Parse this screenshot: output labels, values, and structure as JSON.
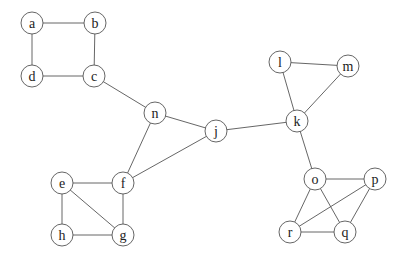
{
  "graph": {
    "node_radius": 11,
    "nodes": [
      {
        "id": "a",
        "label": "a",
        "x": 32,
        "y": 23
      },
      {
        "id": "b",
        "label": "b",
        "x": 95,
        "y": 23
      },
      {
        "id": "c",
        "label": "c",
        "x": 94,
        "y": 76
      },
      {
        "id": "d",
        "label": "d",
        "x": 32,
        "y": 76
      },
      {
        "id": "e",
        "label": "e",
        "x": 62,
        "y": 183
      },
      {
        "id": "f",
        "label": "f",
        "x": 123,
        "y": 183
      },
      {
        "id": "g",
        "label": "g",
        "x": 123,
        "y": 235
      },
      {
        "id": "h",
        "label": "h",
        "x": 62,
        "y": 235
      },
      {
        "id": "j",
        "label": "j",
        "x": 216,
        "y": 131
      },
      {
        "id": "k",
        "label": "k",
        "x": 297,
        "y": 121
      },
      {
        "id": "l",
        "label": "l",
        "x": 280,
        "y": 62
      },
      {
        "id": "m",
        "label": "m",
        "x": 348,
        "y": 66
      },
      {
        "id": "n",
        "label": "n",
        "x": 155,
        "y": 113
      },
      {
        "id": "o",
        "label": "o",
        "x": 315,
        "y": 179
      },
      {
        "id": "p",
        "label": "p",
        "x": 375,
        "y": 179
      },
      {
        "id": "q",
        "label": "q",
        "x": 345,
        "y": 232
      },
      {
        "id": "r",
        "label": "r",
        "x": 290,
        "y": 232
      }
    ],
    "edges": [
      [
        "a",
        "b"
      ],
      [
        "a",
        "d"
      ],
      [
        "b",
        "c"
      ],
      [
        "d",
        "c"
      ],
      [
        "c",
        "n"
      ],
      [
        "n",
        "j"
      ],
      [
        "n",
        "f"
      ],
      [
        "f",
        "j"
      ],
      [
        "j",
        "k"
      ],
      [
        "e",
        "f"
      ],
      [
        "e",
        "h"
      ],
      [
        "e",
        "g"
      ],
      [
        "f",
        "g"
      ],
      [
        "h",
        "g"
      ],
      [
        "l",
        "m"
      ],
      [
        "l",
        "k"
      ],
      [
        "m",
        "k"
      ],
      [
        "k",
        "o"
      ],
      [
        "o",
        "p"
      ],
      [
        "o",
        "r"
      ],
      [
        "o",
        "q"
      ],
      [
        "p",
        "r"
      ],
      [
        "p",
        "q"
      ],
      [
        "r",
        "q"
      ]
    ]
  }
}
